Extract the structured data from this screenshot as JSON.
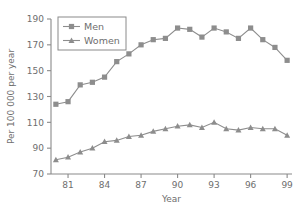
{
  "chart_data": {
    "type": "line",
    "title": "",
    "xlabel": "Year",
    "ylabel": "Per 100 000 per year",
    "xlim": [
      1979.6,
      1999.4
    ],
    "ylim": [
      70,
      190
    ],
    "xticks": [
      81,
      84,
      87,
      90,
      93,
      96,
      99
    ],
    "xtick_labels": [
      "81",
      "84",
      "87",
      "90",
      "93",
      "96",
      "99"
    ],
    "yticks": [
      70,
      90,
      110,
      130,
      150,
      170,
      190
    ],
    "ytick_labels": [
      "70",
      "90",
      "110",
      "130",
      "150",
      "170",
      "190"
    ],
    "grid": false,
    "legend_position": "top-left",
    "x": [
      1980,
      1981,
      1982,
      1983,
      1984,
      1985,
      1986,
      1987,
      1988,
      1989,
      1990,
      1991,
      1992,
      1993,
      1994,
      1995,
      1996,
      1997,
      1998,
      1999
    ],
    "series": [
      {
        "name": "Men",
        "marker": "square",
        "color": "#8d8d8d",
        "values": [
          124,
          126,
          139,
          141,
          145,
          157,
          163,
          170,
          174,
          175,
          183,
          182,
          176,
          183,
          180,
          175,
          183,
          174,
          168,
          158
        ]
      },
      {
        "name": "Women",
        "marker": "triangle",
        "color": "#8d8d8d",
        "values": [
          81,
          83,
          87,
          90,
          95,
          96,
          99,
          100,
          103,
          105,
          107,
          108,
          106,
          110,
          105,
          104,
          106,
          105,
          105,
          100
        ]
      }
    ]
  },
  "legend": {
    "entries": [
      {
        "label": "Men"
      },
      {
        "label": "Women"
      }
    ]
  },
  "colors": {
    "line": "#8d8d8d",
    "axis": "#8a8a8a",
    "text": "#6e6e6e",
    "background": "#ffffff"
  }
}
